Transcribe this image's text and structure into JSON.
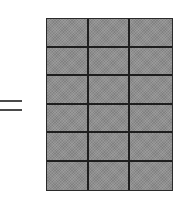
{
  "diagram": {
    "operator": "=",
    "grid": {
      "rows": 6,
      "columns": 3,
      "cell_count": 18,
      "fill_color": "#8f8f8f",
      "line_color": "#1e1e1e"
    }
  }
}
